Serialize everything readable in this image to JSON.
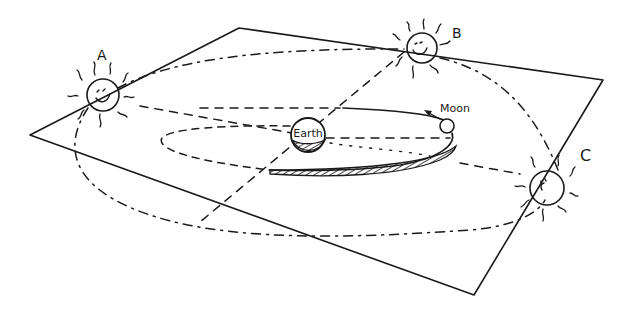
{
  "diagram": {
    "labels": {
      "sun_a": "A",
      "sun_b": "B",
      "sun_c": "C",
      "earth": "Earth",
      "moon": "Moon"
    },
    "colors": {
      "ink": "#1a1a1a",
      "background": "#ffffff"
    },
    "elements": [
      {
        "id": "ecliptic-plane",
        "shape": "parallelogram",
        "style": "solid"
      },
      {
        "id": "sun-orbit",
        "shape": "ellipse",
        "style": "dash-dot"
      },
      {
        "id": "moon-orbit",
        "shape": "ellipse",
        "style": "solid front / dashed back"
      },
      {
        "id": "moon-orbit-shadow",
        "shape": "hatched band"
      },
      {
        "id": "sun-a",
        "shape": "smiling sun"
      },
      {
        "id": "sun-b",
        "shape": "smiling sun"
      },
      {
        "id": "sun-c",
        "shape": "smiling sun"
      },
      {
        "id": "earth",
        "shape": "hatched globe"
      },
      {
        "id": "moon",
        "shape": "small circle"
      },
      {
        "id": "moon-direction-arrow",
        "shape": "arrow"
      },
      {
        "id": "sightlines",
        "shape": "dashed lines from Earth to suns A, B, C"
      }
    ]
  }
}
